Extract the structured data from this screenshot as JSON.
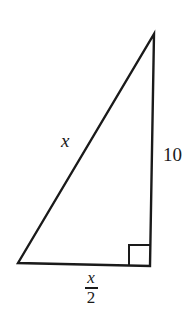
{
  "diagram": {
    "type": "right-triangle",
    "stroke_color": "#1a1a1a",
    "background": "#ffffff",
    "vertices": {
      "top": [
        154,
        34
      ],
      "bottom_left": [
        18,
        263
      ],
      "bottom_right": [
        150,
        266
      ]
    },
    "right_angle_at": "bottom_right",
    "labels": {
      "hypotenuse": "x",
      "vertical_leg": "10",
      "horizontal_leg": {
        "numerator": "x",
        "denominator": "2"
      }
    }
  }
}
